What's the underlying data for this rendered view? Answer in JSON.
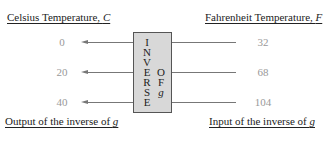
{
  "headers": {
    "left": "Celsius Temperature, ",
    "left_var": "C",
    "right": "Fahrenheit Temperature, ",
    "right_var": "F"
  },
  "box": {
    "col1": [
      "I",
      "N",
      "V",
      "E",
      "R",
      "S",
      "E"
    ],
    "col2": [
      "O",
      "F",
      "g"
    ]
  },
  "rows": [
    {
      "output": "0",
      "input": "32"
    },
    {
      "output": "20",
      "input": "68"
    },
    {
      "output": "40",
      "input": "104"
    }
  ],
  "footers": {
    "left": "Output of the inverse of ",
    "left_var": "g",
    "right": "Input of the inverse of ",
    "right_var": "g"
  },
  "colors": {
    "box_fill": "#d8d8d8",
    "arrow": "#777777",
    "number_text": "#999999"
  }
}
